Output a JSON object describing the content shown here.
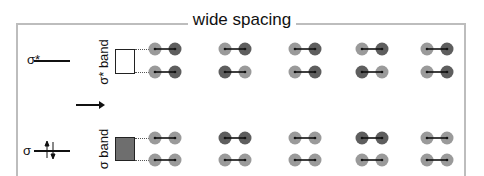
{
  "title": "wide spacing",
  "levels": {
    "sigma_star": {
      "label": "σ*"
    },
    "sigma": {
      "label": "σ"
    }
  },
  "bands": {
    "sigma_star": {
      "label": "σ* band",
      "fill": "#ffffff"
    },
    "sigma": {
      "label": "σ band",
      "fill": "#6e6e6e"
    }
  },
  "colors": {
    "light": "#9a9a9a",
    "dark": "#5e5e5e",
    "frame": "#bdbdbd",
    "bond": "#111111"
  },
  "dimer_columns_x": [
    165,
    235,
    305,
    372,
    437
  ],
  "dimer_rows": [
    {
      "group": "sigma_star",
      "y": 49,
      "pattern": [
        "LD",
        "LD",
        "LD",
        "LD",
        "LD"
      ]
    },
    {
      "group": "sigma_star",
      "y": 72,
      "pattern": [
        "LD",
        "DL",
        "LD",
        "DL",
        "LD"
      ]
    },
    {
      "group": "sigma",
      "y": 138,
      "pattern": [
        "LL",
        "DD",
        "LL",
        "DD",
        "LL"
      ]
    },
    {
      "group": "sigma",
      "y": 160,
      "pattern": [
        "LL",
        "LL",
        "LL",
        "LL",
        "LL"
      ]
    }
  ]
}
